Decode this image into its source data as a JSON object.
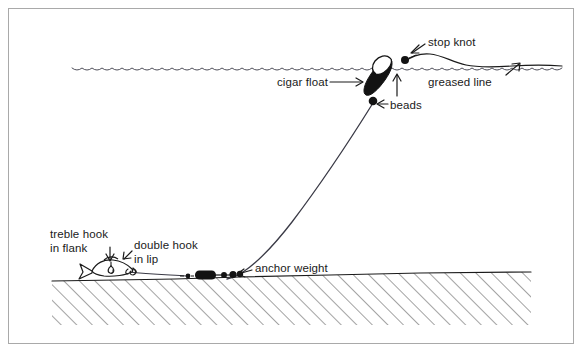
{
  "figure": {
    "background_color": "#ffffff",
    "ink_color": "#1a1a1a",
    "frame_color": "#a9a9a9",
    "width": 584,
    "height": 353
  },
  "labels": {
    "cigar_float": "cigar float",
    "stop_knot": "stop knot",
    "greased_line": "greased line",
    "beads": "beads",
    "anchor_weight": "anchor weight",
    "treble_hook_line1": "treble hook",
    "treble_hook_line2": "in flank",
    "double_hook_line1": "double hook",
    "double_hook_line2": "in lip"
  },
  "diagram_parts": {
    "water_surface": "wavy-water-line",
    "lakebed": "hatched-lakebed",
    "float": "cigar-float-body",
    "float_tip": "cigar-float-tip",
    "upper_bead": "stop-knot-bead",
    "lower_bead": "line-bead",
    "main_line": "mainline-from-float-to-weight",
    "surface_line": "greased-line-on-surface",
    "weight": "anchor-weight-body",
    "swivels": "bead-swivel-group",
    "bait_fish": "dead-bait-fish",
    "treble_hook": "treble-hook-in-flank",
    "double_hook": "double-hook-in-lip"
  }
}
